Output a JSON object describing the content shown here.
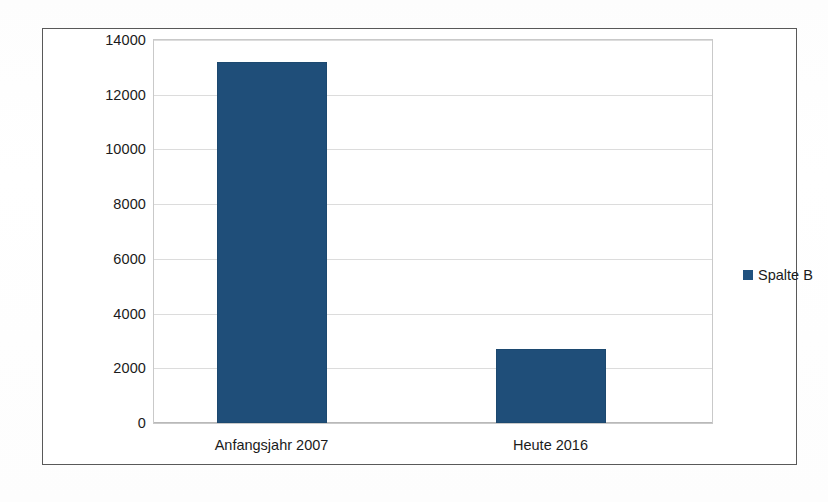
{
  "chart_data": {
    "type": "bar",
    "title": "",
    "subtitle": "",
    "xlabel": "",
    "ylabel": "",
    "categories": [
      "Anfangsjahr 2007",
      "Heute 2016"
    ],
    "series": [
      {
        "name": "Spalte B",
        "color": "#1F4E79",
        "values": [
          13200,
          2700
        ]
      }
    ],
    "ylim": [
      0,
      14000
    ],
    "ytick_values": [
      0,
      2000,
      4000,
      6000,
      8000,
      10000,
      12000,
      14000
    ],
    "ytick_labels": [
      "0",
      "2000",
      "4000",
      "6000",
      "8000",
      "10000",
      "12000",
      "14000"
    ],
    "grid": true,
    "grid_axis": "y",
    "legend": {
      "position": "right",
      "entries": [
        {
          "label": "Spalte B",
          "marker": "square-swatch",
          "color": "#21527F"
        }
      ]
    },
    "frame": true,
    "plot_background": "#FFFFFF"
  },
  "colors": {
    "bar": "#1F4E79",
    "legend_swatch": "#21527F",
    "frame_border": "#595959",
    "plot_border": "#C9C9C9",
    "gridline": "#DCDCDC",
    "text": "#1B1B1B",
    "page_background": "#FEFEFE"
  }
}
